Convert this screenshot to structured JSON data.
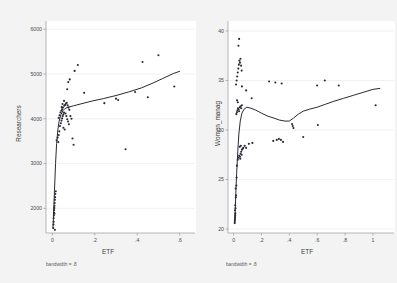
{
  "figure": {
    "background_color": "#f4f4f4",
    "plot_background_color": "#ffffff",
    "marker_color": "#2a2a33",
    "line_color": "#1e1e28",
    "grid_color": "#e3e3e6",
    "axis_color": "#9a9aa0"
  },
  "chart_data": [
    {
      "type": "scatter",
      "panel": "left",
      "title": "",
      "xlabel": "ETF",
      "ylabel": "Researchers",
      "note": "bandwidth = .8",
      "xlim": [
        -0.03,
        0.63
      ],
      "ylim": [
        1450,
        6050
      ],
      "xticks": [
        0,
        0.2,
        0.4,
        0.6
      ],
      "xticklabels": [
        "0",
        ".2",
        ".4",
        ".6"
      ],
      "yticks": [
        2000,
        3000,
        4000,
        5000,
        6000
      ],
      "yticklabels": [
        "2000",
        "3000",
        "4000",
        "5000",
        "6000"
      ],
      "grid": true,
      "legend": "none",
      "points": [
        [
          0.004,
          1560
        ],
        [
          0.005,
          1640
        ],
        [
          0.006,
          1700
        ],
        [
          0.006,
          1780
        ],
        [
          0.007,
          1840
        ],
        [
          0.008,
          1900
        ],
        [
          0.008,
          1960
        ],
        [
          0.009,
          2010
        ],
        [
          0.01,
          2060
        ],
        [
          0.011,
          2120
        ],
        [
          0.012,
          2190
        ],
        [
          0.013,
          2250
        ],
        [
          0.014,
          2320
        ],
        [
          0.016,
          2380
        ],
        [
          0.012,
          1520
        ],
        [
          0.01,
          1880
        ],
        [
          0.02,
          3520
        ],
        [
          0.025,
          3580
        ],
        [
          0.03,
          3640
        ],
        [
          0.033,
          3720
        ],
        [
          0.028,
          3480
        ],
        [
          0.036,
          3840
        ],
        [
          0.04,
          3900
        ],
        [
          0.043,
          3960
        ],
        [
          0.046,
          4010
        ],
        [
          0.049,
          4060
        ],
        [
          0.052,
          4100
        ],
        [
          0.055,
          4140
        ],
        [
          0.03,
          4020
        ],
        [
          0.034,
          4080
        ],
        [
          0.038,
          4140
        ],
        [
          0.042,
          4180
        ],
        [
          0.046,
          4210
        ],
        [
          0.05,
          4250
        ],
        [
          0.056,
          4290
        ],
        [
          0.06,
          4310
        ],
        [
          0.064,
          4340
        ],
        [
          0.068,
          4360
        ],
        [
          0.072,
          4300
        ],
        [
          0.076,
          4250
        ],
        [
          0.08,
          4200
        ],
        [
          0.062,
          4120
        ],
        [
          0.066,
          4060
        ],
        [
          0.07,
          3990
        ],
        [
          0.074,
          3940
        ],
        [
          0.078,
          3880
        ],
        [
          0.052,
          3800
        ],
        [
          0.058,
          3760
        ],
        [
          0.085,
          4060
        ],
        [
          0.09,
          4000
        ],
        [
          0.095,
          3560
        ],
        [
          0.1,
          3420
        ],
        [
          0.07,
          4660
        ],
        [
          0.075,
          4820
        ],
        [
          0.082,
          4880
        ],
        [
          0.105,
          5070
        ],
        [
          0.12,
          5200
        ],
        [
          0.15,
          4580
        ],
        [
          0.245,
          4350
        ],
        [
          0.3,
          4450
        ],
        [
          0.31,
          4420
        ],
        [
          0.345,
          3320
        ],
        [
          0.39,
          4600
        ],
        [
          0.425,
          5270
        ],
        [
          0.45,
          4480
        ],
        [
          0.5,
          5420
        ],
        [
          0.575,
          4720
        ],
        [
          0.055,
          4400
        ],
        [
          0.048,
          4330
        ],
        [
          0.044,
          4260
        ]
      ],
      "lowess_curve": [
        [
          0.003,
          1560
        ],
        [
          0.006,
          1900
        ],
        [
          0.01,
          2400
        ],
        [
          0.015,
          3000
        ],
        [
          0.02,
          3450
        ],
        [
          0.026,
          3760
        ],
        [
          0.032,
          3950
        ],
        [
          0.04,
          4090
        ],
        [
          0.05,
          4180
        ],
        [
          0.06,
          4230
        ],
        [
          0.075,
          4260
        ],
        [
          0.1,
          4290
        ],
        [
          0.14,
          4340
        ],
        [
          0.19,
          4400
        ],
        [
          0.24,
          4450
        ],
        [
          0.3,
          4520
        ],
        [
          0.36,
          4600
        ],
        [
          0.42,
          4690
        ],
        [
          0.47,
          4790
        ],
        [
          0.52,
          4900
        ],
        [
          0.57,
          5010
        ],
        [
          0.6,
          5060
        ]
      ]
    },
    {
      "type": "scatter",
      "panel": "right",
      "title": "",
      "xlabel": "ETF",
      "ylabel": "Women_manag",
      "note": "bandwidth = .8",
      "xlim": [
        -0.04,
        1.08
      ],
      "ylim": [
        19.6,
        40.4
      ],
      "xticks": [
        0,
        0.2,
        0.4,
        0.6,
        0.8,
        1.0
      ],
      "xticklabels": [
        "0",
        ".2",
        ".4",
        ".6",
        ".8",
        "1"
      ],
      "yticks": [
        20,
        25,
        30,
        35,
        40
      ],
      "yticklabels": [
        "20",
        "25",
        "30",
        "35",
        "40"
      ],
      "grid": true,
      "legend": "none",
      "points": [
        [
          0.008,
          20.6
        ],
        [
          0.009,
          20.8
        ],
        [
          0.01,
          21.0
        ],
        [
          0.011,
          21.2
        ],
        [
          0.012,
          21.4
        ],
        [
          0.013,
          21.6
        ],
        [
          0.01,
          21.9
        ],
        [
          0.014,
          22.1
        ],
        [
          0.012,
          22.4
        ],
        [
          0.016,
          23.2
        ],
        [
          0.018,
          23.4
        ],
        [
          0.015,
          24.1
        ],
        [
          0.02,
          24.4
        ],
        [
          0.022,
          25.2
        ],
        [
          0.024,
          26.4
        ],
        [
          0.03,
          27.0
        ],
        [
          0.034,
          27.2
        ],
        [
          0.04,
          27.4
        ],
        [
          0.046,
          27.3
        ],
        [
          0.05,
          27.6
        ],
        [
          0.055,
          27.8
        ],
        [
          0.06,
          28.0
        ],
        [
          0.065,
          28.1
        ],
        [
          0.07,
          28.2
        ],
        [
          0.058,
          27.5
        ],
        [
          0.048,
          27.1
        ],
        [
          0.044,
          28.3
        ],
        [
          0.052,
          28.4
        ],
        [
          0.08,
          28.4
        ],
        [
          0.09,
          28.2
        ],
        [
          0.11,
          28.6
        ],
        [
          0.135,
          28.7
        ],
        [
          0.02,
          31.6
        ],
        [
          0.024,
          31.8
        ],
        [
          0.028,
          32.0
        ],
        [
          0.032,
          32.2
        ],
        [
          0.036,
          32.1
        ],
        [
          0.04,
          31.9
        ],
        [
          0.045,
          32.3
        ],
        [
          0.05,
          32.4
        ],
        [
          0.055,
          32.2
        ],
        [
          0.06,
          32.5
        ],
        [
          0.025,
          33.0
        ],
        [
          0.03,
          32.8
        ],
        [
          0.018,
          34.6
        ],
        [
          0.022,
          35.0
        ],
        [
          0.026,
          35.4
        ],
        [
          0.03,
          35.8
        ],
        [
          0.034,
          36.2
        ],
        [
          0.038,
          36.6
        ],
        [
          0.042,
          37.0
        ],
        [
          0.046,
          36.8
        ],
        [
          0.05,
          37.2
        ],
        [
          0.054,
          36.5
        ],
        [
          0.058,
          36.0
        ],
        [
          0.035,
          38.5
        ],
        [
          0.04,
          39.2
        ],
        [
          0.06,
          34.4
        ],
        [
          0.09,
          34.0
        ],
        [
          0.13,
          33.2
        ],
        [
          0.285,
          28.9
        ],
        [
          0.31,
          29.0
        ],
        [
          0.325,
          29.1
        ],
        [
          0.34,
          29.0
        ],
        [
          0.355,
          28.8
        ],
        [
          0.3,
          34.8
        ],
        [
          0.345,
          34.7
        ],
        [
          0.255,
          34.9
        ],
        [
          0.42,
          30.6
        ],
        [
          0.425,
          30.4
        ],
        [
          0.43,
          30.2
        ],
        [
          0.5,
          29.3
        ],
        [
          0.6,
          34.5
        ],
        [
          0.605,
          30.5
        ],
        [
          0.655,
          35.0
        ],
        [
          0.755,
          34.5
        ],
        [
          1.02,
          32.5
        ]
      ],
      "lowess_curve": [
        [
          0.008,
          20.6
        ],
        [
          0.012,
          22.0
        ],
        [
          0.016,
          23.6
        ],
        [
          0.022,
          25.6
        ],
        [
          0.03,
          27.8
        ],
        [
          0.038,
          29.6
        ],
        [
          0.048,
          30.9
        ],
        [
          0.06,
          31.7
        ],
        [
          0.075,
          32.1
        ],
        [
          0.095,
          32.3
        ],
        [
          0.125,
          32.2
        ],
        [
          0.16,
          32.0
        ],
        [
          0.2,
          31.7
        ],
        [
          0.245,
          31.4
        ],
        [
          0.29,
          31.2
        ],
        [
          0.33,
          31.0
        ],
        [
          0.37,
          30.9
        ],
        [
          0.4,
          30.9
        ],
        [
          0.43,
          31.2
        ],
        [
          0.465,
          31.6
        ],
        [
          0.5,
          31.9
        ],
        [
          0.545,
          32.1
        ],
        [
          0.6,
          32.3
        ],
        [
          0.66,
          32.6
        ],
        [
          0.72,
          32.9
        ],
        [
          0.79,
          33.2
        ],
        [
          0.86,
          33.5
        ],
        [
          0.93,
          33.8
        ],
        [
          1.0,
          34.1
        ],
        [
          1.05,
          34.2
        ]
      ]
    }
  ]
}
